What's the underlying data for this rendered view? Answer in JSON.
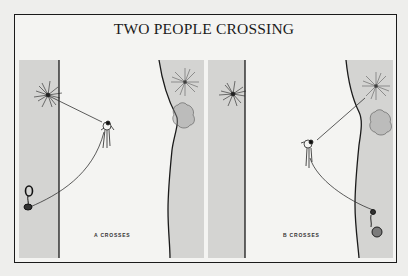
{
  "figure": {
    "title": "TWO PEOPLE CROSSING",
    "panels": [
      {
        "id": "A",
        "caption": "A CROSSES"
      },
      {
        "id": "B",
        "caption": "B CROSSES"
      }
    ],
    "colors": {
      "background": "#f4f4f2",
      "rock_strip": "#d4d4d2",
      "line": "#1a1a1a"
    }
  }
}
